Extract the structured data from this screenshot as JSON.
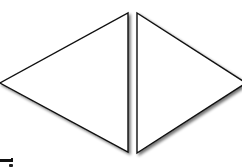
{
  "canvas": {
    "width": 242,
    "height": 167,
    "background": "#ffffff"
  },
  "shapes": [
    {
      "name": "left-triangle",
      "type": "triangle",
      "points": [
        [
          128,
          13
        ],
        [
          128,
          152
        ],
        [
          0,
          83
        ]
      ],
      "fill": "#ffffff",
      "stroke": "#111111",
      "shadow": true
    },
    {
      "name": "right-triangle",
      "type": "triangle",
      "points": [
        [
          137,
          13
        ],
        [
          137,
          153
        ],
        [
          246,
          83
        ]
      ],
      "fill": "#ffffff",
      "stroke": "#111111",
      "shadow": true
    }
  ],
  "colors": {
    "stroke": "#111111",
    "shadow": "#8a8a8a"
  }
}
